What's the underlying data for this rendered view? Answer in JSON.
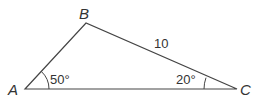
{
  "diagram": {
    "type": "triangle",
    "stroke_color": "#444444",
    "vertices": {
      "A": {
        "label": "A",
        "x": 25,
        "y": 89
      },
      "B": {
        "label": "B",
        "x": 86,
        "y": 23
      },
      "C": {
        "label": "C",
        "x": 237,
        "y": 89
      }
    },
    "angles": {
      "A": {
        "label": "50°"
      },
      "C": {
        "label": "20°"
      }
    },
    "sides": {
      "BC": {
        "label": "10"
      }
    }
  }
}
